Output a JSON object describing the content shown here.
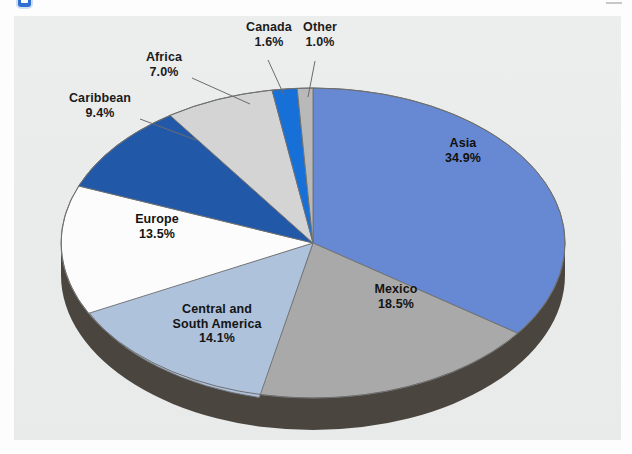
{
  "figure": {
    "background_color": "#ebebeb",
    "page_color": "#fdfdfd",
    "marker_color": "#2f6fd0",
    "depth_color": "#4a453e"
  },
  "chart_data": {
    "type": "pie",
    "title": "",
    "subtitle": "",
    "legend_position": "labels-on-slices",
    "is_3d": true,
    "start_angle_deg": 0,
    "direction": "clockwise",
    "total": 100.0,
    "categories": [
      "Asia",
      "Mexico",
      "Central and South America",
      "Europe",
      "Caribbean",
      "Africa",
      "Canada",
      "Other"
    ],
    "values": [
      34.9,
      18.5,
      14.1,
      13.5,
      9.4,
      7.0,
      1.6,
      1.0
    ],
    "colors": [
      "#6789d4",
      "#a9a9a9",
      "#aec2dc",
      "#fcfcfc",
      "#2159a8",
      "#d4d4d4",
      "#1670d8",
      "#b9b9b9"
    ],
    "slices": [
      {
        "label": "Asia",
        "pct_text": "34.9%",
        "value": 34.9,
        "color": "#6789d4",
        "label_placement": "inside",
        "has_leader": false
      },
      {
        "label": "Mexico",
        "pct_text": "18.5%",
        "value": 18.5,
        "color": "#a9a9a9",
        "label_placement": "inside",
        "has_leader": false
      },
      {
        "label": "Central and South America",
        "pct_text": "14.1%",
        "value": 14.1,
        "color": "#aec2dc",
        "label_placement": "inside",
        "has_leader": false
      },
      {
        "label": "Europe",
        "pct_text": "13.5%",
        "value": 13.5,
        "color": "#fcfcfc",
        "label_placement": "inside",
        "has_leader": false
      },
      {
        "label": "Caribbean",
        "pct_text": "9.4%",
        "value": 9.4,
        "color": "#2159a8",
        "label_placement": "outside",
        "has_leader": true
      },
      {
        "label": "Africa",
        "pct_text": "7.0%",
        "value": 7.0,
        "color": "#d4d4d4",
        "label_placement": "outside",
        "has_leader": true
      },
      {
        "label": "Canada",
        "pct_text": "1.6%",
        "value": 1.6,
        "color": "#1670d8",
        "label_placement": "outside",
        "has_leader": true
      },
      {
        "label": "Other",
        "pct_text": "1.0%",
        "value": 1.0,
        "color": "#b9b9b9",
        "label_placement": "outside",
        "has_leader": true
      }
    ]
  },
  "labels": {
    "asia": {
      "name": "Asia",
      "pct": "34.9%"
    },
    "mexico": {
      "name": "Mexico",
      "pct": "18.5%"
    },
    "csa": {
      "name1": "Central and",
      "name2": "South America",
      "pct": "14.1%"
    },
    "europe": {
      "name": "Europe",
      "pct": "13.5%"
    },
    "carib": {
      "name": "Caribbean",
      "pct": "9.4%"
    },
    "africa": {
      "name": "Africa",
      "pct": "7.0%"
    },
    "canada": {
      "name": "Canada",
      "pct": "1.6%"
    },
    "other": {
      "name": "Other",
      "pct": "1.0%"
    }
  }
}
